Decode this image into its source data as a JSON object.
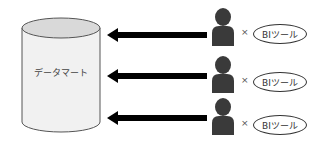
{
  "diagram": {
    "datamart_label": "データマート",
    "rows": [
      {
        "connector": "×",
        "tool_label": "BIツール"
      },
      {
        "connector": "×",
        "tool_label": "BIツール"
      },
      {
        "connector": "×",
        "tool_label": "BIツール"
      }
    ],
    "colors": {
      "arrow": "#000000",
      "person": "#3a3a3a",
      "cylinder_fill": "#f1f1f1",
      "cylinder_top": "#d9d9d9"
    }
  }
}
